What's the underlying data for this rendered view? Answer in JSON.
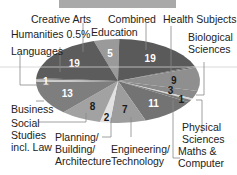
{
  "chart_data": {
    "type": "pie",
    "title": "",
    "unit": "%",
    "slices": [
      {
        "label": "Education",
        "value": 5,
        "value_label": "5",
        "color": "#9a9a9a",
        "text_color": "#ffffff"
      },
      {
        "label": "Combined",
        "value": 19,
        "value_label": "19",
        "color": "#5a5a5a",
        "text_color": "#ffffff"
      },
      {
        "label": "Health Subjects",
        "value": 0.5,
        "value_label": "",
        "color": "#6a6a6a",
        "text_color": "#ffffff"
      },
      {
        "label": "Biological Sciences",
        "value": 9,
        "value_label": "9",
        "color": "#8f8f8f",
        "text_color": "#1a1a1a"
      },
      {
        "label": "Physical Sciences",
        "value": 3,
        "value_label": "3",
        "color": "#8a8a8a",
        "text_color": "#1a1a1a"
      },
      {
        "label": "Physical Sciences (separator)",
        "value": 0.6,
        "value_label": "",
        "color": "#d8d8d8",
        "text_color": "#1a1a1a"
      },
      {
        "label": "Maths & Computer",
        "value": 1,
        "value_label": "1",
        "color": "#7a7a7a",
        "text_color": "#1a1a1a"
      },
      {
        "label": "Maths & Computer (main)",
        "value": 11,
        "value_label": "11",
        "color": "#737373",
        "text_color": "#ffffff"
      },
      {
        "label": "Engineering/ Technology",
        "value": 7,
        "value_label": "7",
        "color": "#9d9d9d",
        "text_color": "#1a1a1a"
      },
      {
        "label": "Planning/ Building/ Architecture",
        "value": 2,
        "value_label": "2",
        "color": "#e2e2e2",
        "text_color": "#1a1a1a"
      },
      {
        "label": "Social Studies incl. Law",
        "value": 8,
        "value_label": "8",
        "color": "#a2a2a2",
        "text_color": "#1a1a1a"
      },
      {
        "label": "Business",
        "value": 13,
        "value_label": "13",
        "color": "#7e7e7e",
        "text_color": "#ffffff"
      },
      {
        "label": "Languages",
        "value": 1,
        "value_label": "1",
        "color": "#c8c8c8",
        "text_color": "#ffffff"
      },
      {
        "label": "Humanities",
        "value": 0.5,
        "value_label": "",
        "color": "#606060",
        "text_color": "#ffffff"
      },
      {
        "label": "Creative Arts",
        "value": 19,
        "value_label": "19",
        "color": "#5c5c5c",
        "text_color": "#ffffff"
      }
    ],
    "labels": {
      "creative_arts": "Creative Arts",
      "humanities": "Humanities 0.5%",
      "languages": "Languages",
      "education": "Education",
      "combined": "Combined",
      "health": "Health Subjects",
      "bio1": "Biological",
      "bio2": "Sciences",
      "business": "Business",
      "social1": "Social",
      "social2": "Studies",
      "social3": "incl. Law",
      "plan1": "Planning/",
      "plan2": "Building/",
      "plan3": "Architecture",
      "eng1": "Engineering/",
      "eng2": "Technology",
      "phys1": "Physical",
      "phys2": "Sciences",
      "math1": "Maths &",
      "math2": "Computer"
    },
    "legend": "none"
  }
}
